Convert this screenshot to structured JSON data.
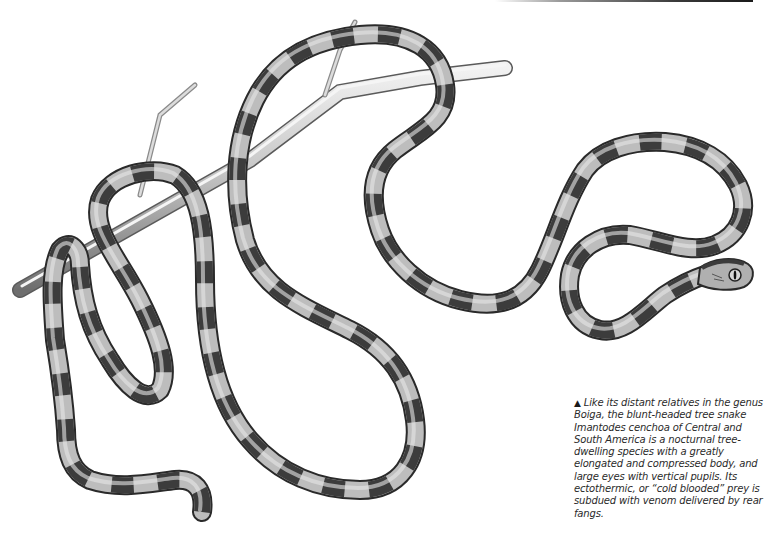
{
  "illustration": {
    "subject": "Blunt-headed tree snake coiled on a thorny branch",
    "palette": {
      "band_light": "#b8b8b8",
      "band_dark": "#3c3c3c",
      "outline": "#2a2a2a",
      "branch": "#c9c9c9",
      "branch_shade": "#8a8a8a"
    }
  },
  "caption": {
    "marker": "▲",
    "text": "Like its distant relatives in the genus Boiga, the blunt-headed tree snake Imantodes cenchoa of Central and South America is a nocturnal tree-dwelling species with a greatly elongated and compressed body, and large eyes with vertical pupils. Its ectothermic, or “cold blooded” prey is subdued with venom delivered by rear fangs."
  }
}
